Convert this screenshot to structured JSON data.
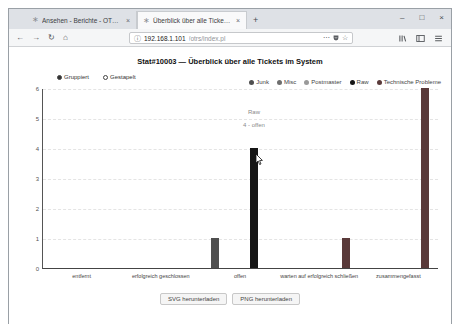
{
  "window_controls": {
    "minimize": "–",
    "maximize": "□",
    "close": "×"
  },
  "browser": {
    "tabs": [
      {
        "favicon": "∗",
        "title": "Ansehen - Berichte - OTRS 6",
        "close": "×"
      },
      {
        "favicon": "∗",
        "title": "Überblick über alle Tickets im...",
        "close": "×"
      }
    ],
    "new_tab": "+",
    "nav": {
      "back": "←",
      "forward": "→",
      "reload": "↻",
      "home": "⌂"
    },
    "urlbar": {
      "info_icon": "ⓘ",
      "domain": "192.168.1.101",
      "path": "/otrs/index.pl",
      "more": "⋯",
      "star": "☆"
    }
  },
  "content": {
    "title": "Stat#10003 — Überblick über alle Tickets im System",
    "modes": [
      {
        "label": "Gruppiert",
        "selected": true
      },
      {
        "label": "Gestapelt",
        "selected": false
      }
    ],
    "buttons": {
      "svg": "SVG herunterladen",
      "png": "PNG herunterladen"
    }
  },
  "chart_data": {
    "type": "bar",
    "title": "Stat#10003 — Überblick über alle Tickets im System",
    "categories": [
      "entfernt",
      "erfolgreich geschlossen",
      "offen",
      "warten auf erfolgreich schließen",
      "zusammengefasst"
    ],
    "series": [
      {
        "name": "Junk",
        "color": "#4f4f4f",
        "values": [
          0,
          0,
          1,
          0,
          0
        ]
      },
      {
        "name": "Misc",
        "color": "#6e6e6e",
        "values": [
          0,
          0,
          0,
          0,
          0
        ]
      },
      {
        "name": "Postmaster",
        "color": "#9a9a9a",
        "values": [
          0,
          0,
          0,
          0,
          0
        ]
      },
      {
        "name": "Raw",
        "color": "#161616",
        "values": [
          0,
          0,
          4,
          0,
          0
        ]
      },
      {
        "name": "Technische Probleme",
        "color": "#5a3a3a",
        "values": [
          0,
          0,
          0,
          1,
          6
        ]
      }
    ],
    "xlabel": "",
    "ylabel": "",
    "ylim": [
      0,
      6
    ],
    "yticks": [
      0,
      1,
      2,
      3,
      4,
      5,
      6
    ],
    "grid": true,
    "legend_position": "top-right",
    "tooltip": {
      "series": "Raw",
      "category": "offen",
      "value": 4,
      "line1": "Raw",
      "line2": "4 - offen"
    }
  }
}
